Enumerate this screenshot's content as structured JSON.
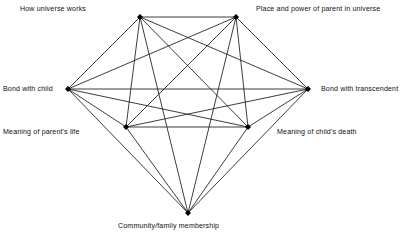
{
  "figure": {
    "type": "network-diagram",
    "background_color": "#ffffff",
    "edge_color": "#1a1a1a",
    "node_color": "#000000",
    "text_color": "#101010"
  },
  "chart_data": {
    "type": "network",
    "title": "",
    "complete_graph": true,
    "node_count": 7,
    "edge_count": 21,
    "nodes": [
      {
        "id": "how_universe_works",
        "label": "How universe works",
        "x": 140,
        "y": 17,
        "label_x": 20,
        "label_y": 5,
        "align": "left"
      },
      {
        "id": "place_power_parent",
        "label": "Place and power of parent in universe",
        "x": 236,
        "y": 17,
        "label_x": 256,
        "label_y": 5,
        "align": "right"
      },
      {
        "id": "bond_with_child",
        "label": "Bond with child",
        "x": 68,
        "y": 89,
        "label_x": 3,
        "label_y": 85,
        "align": "left"
      },
      {
        "id": "bond_with_transcendent",
        "label": "Bond with transcendent",
        "x": 308,
        "y": 89,
        "label_x": 321,
        "label_y": 85,
        "align": "right"
      },
      {
        "id": "meaning_parents_life",
        "label": "Meaning of parent's life",
        "x": 126,
        "y": 127,
        "label_x": 3,
        "label_y": 128,
        "align": "left"
      },
      {
        "id": "meaning_childs_death",
        "label": "Meaning of child's death",
        "x": 248,
        "y": 127,
        "label_x": 277,
        "label_y": 128,
        "align": "right"
      },
      {
        "id": "community_family",
        "label": "Community/family membership",
        "x": 188,
        "y": 213,
        "label_x": 118,
        "label_y": 222,
        "align": "center"
      }
    ],
    "edges": [
      {
        "source": "how_universe_works",
        "target": "place_power_parent"
      },
      {
        "source": "how_universe_works",
        "target": "bond_with_child"
      },
      {
        "source": "how_universe_works",
        "target": "bond_with_transcendent"
      },
      {
        "source": "how_universe_works",
        "target": "meaning_parents_life"
      },
      {
        "source": "how_universe_works",
        "target": "meaning_childs_death"
      },
      {
        "source": "how_universe_works",
        "target": "community_family"
      },
      {
        "source": "place_power_parent",
        "target": "bond_with_child"
      },
      {
        "source": "place_power_parent",
        "target": "bond_with_transcendent"
      },
      {
        "source": "place_power_parent",
        "target": "meaning_parents_life"
      },
      {
        "source": "place_power_parent",
        "target": "meaning_childs_death"
      },
      {
        "source": "place_power_parent",
        "target": "community_family"
      },
      {
        "source": "bond_with_child",
        "target": "bond_with_transcendent"
      },
      {
        "source": "bond_with_child",
        "target": "meaning_parents_life"
      },
      {
        "source": "bond_with_child",
        "target": "meaning_childs_death"
      },
      {
        "source": "bond_with_child",
        "target": "community_family"
      },
      {
        "source": "bond_with_transcendent",
        "target": "meaning_parents_life"
      },
      {
        "source": "bond_with_transcendent",
        "target": "meaning_childs_death"
      },
      {
        "source": "bond_with_transcendent",
        "target": "community_family"
      },
      {
        "source": "meaning_parents_life",
        "target": "meaning_childs_death"
      },
      {
        "source": "meaning_parents_life",
        "target": "community_family"
      },
      {
        "source": "meaning_childs_death",
        "target": "community_family"
      }
    ]
  }
}
